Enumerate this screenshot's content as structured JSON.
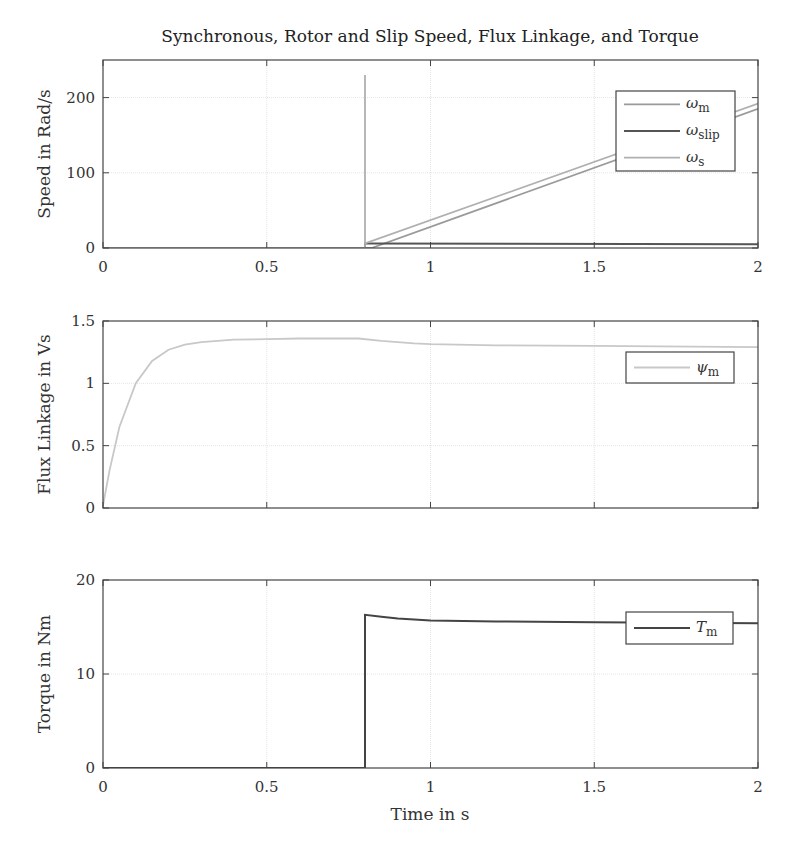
{
  "chart_data": [
    {
      "type": "line",
      "title": "Synchronous, Rotor and Slip Speed, Flux Linkage, and Torque",
      "xlabel": "Time in s",
      "ylabel": "Speed in Rad/s",
      "xlim": [
        0,
        2
      ],
      "ylim": [
        0,
        250
      ],
      "xticks": [
        "0",
        "0.5",
        "1",
        "1.5",
        "2"
      ],
      "yticks": [
        "0",
        "100",
        "200"
      ],
      "grid": true,
      "legend_position": "upper right",
      "series": [
        {
          "name": "ω_m",
          "label_main": "ω",
          "label_sub": "m",
          "color": "#9a9a9a",
          "x": [
            0,
            0.8,
            0.8,
            0.82,
            2.0
          ],
          "y": [
            0,
            0,
            0,
            0,
            185
          ]
        },
        {
          "name": "ω_slip",
          "label_main": "ω",
          "label_sub": "slip",
          "color": "#555555",
          "x": [
            0,
            0.8,
            0.8,
            0.82,
            2.0
          ],
          "y": [
            0,
            0,
            6,
            6,
            5
          ]
        },
        {
          "name": "ω_s",
          "label_main": "ω",
          "label_sub": "s",
          "color": "#b0b0b0",
          "x": [
            0,
            0.8,
            0.8,
            0.8,
            0.8,
            2.0
          ],
          "y": [
            0,
            0,
            230,
            0,
            6,
            192
          ]
        }
      ]
    },
    {
      "type": "line",
      "xlabel": "",
      "ylabel": "Flux Linkage in Vs",
      "xlim": [
        0,
        2
      ],
      "ylim": [
        0,
        1.5
      ],
      "xticks": [
        "",
        "",
        "",
        "",
        ""
      ],
      "yticks": [
        "0",
        "0.5",
        "1",
        "1.5"
      ],
      "grid": true,
      "legend_position": "upper right",
      "series": [
        {
          "name": "ψ_m",
          "label_main": "ψ",
          "label_sub": "m",
          "color": "#c8c8c8",
          "x": [
            0,
            0.02,
            0.05,
            0.1,
            0.15,
            0.2,
            0.25,
            0.3,
            0.4,
            0.5,
            0.6,
            0.7,
            0.78,
            0.85,
            0.95,
            1.0,
            1.2,
            1.5,
            2.0
          ],
          "y": [
            0.02,
            0.3,
            0.65,
            1.0,
            1.18,
            1.27,
            1.31,
            1.33,
            1.35,
            1.355,
            1.36,
            1.36,
            1.36,
            1.34,
            1.32,
            1.315,
            1.305,
            1.3,
            1.29
          ]
        }
      ]
    },
    {
      "type": "line",
      "xlabel": "Time in s",
      "ylabel": "Torque in Nm",
      "xlim": [
        0,
        2
      ],
      "ylim": [
        0,
        20
      ],
      "xticks": [
        "0",
        "0.5",
        "1",
        "1.5",
        "2"
      ],
      "yticks": [
        "0",
        "10",
        "20"
      ],
      "grid": true,
      "legend_position": "upper right",
      "series": [
        {
          "name": "T_m",
          "label_main": "T",
          "label_sub": "m",
          "color": "#444444",
          "x": [
            0,
            0.8,
            0.8,
            0.85,
            0.9,
            1.0,
            1.2,
            1.5,
            2.0
          ],
          "y": [
            0,
            0,
            16.3,
            16.1,
            15.9,
            15.7,
            15.6,
            15.5,
            15.4
          ]
        }
      ]
    }
  ],
  "figure": {
    "title": "Synchronous, Rotor and Slip Speed, Flux Linkage, and Torque",
    "xlabel": "Time in s"
  }
}
